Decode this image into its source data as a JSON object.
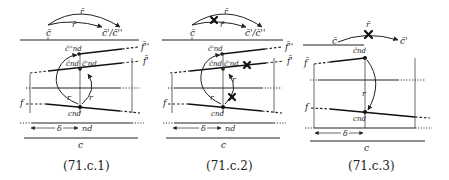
{
  "panels": [
    {
      "id": "71.c.1",
      "caption": "(71.c.1)",
      "labels": {
        "c_bar": "c̄",
        "target": "c̄'/c̄''",
        "r_bar_top": "r̄",
        "r_bar_mid": "r̄",
        "c_nd_pp": "c̄''nd",
        "c_nd_bar": "c̄nd",
        "c_nd_p": "c̄'nd",
        "f_pp": "f̄''",
        "f_p": "f̄'",
        "f": "f",
        "r_left": "r",
        "r_right": "r",
        "c_nd": "cnd",
        "delta": "δ",
        "nd": "nd",
        "c": "c"
      },
      "blocked": []
    },
    {
      "id": "71.c.2",
      "caption": "(71.c.2)",
      "labels": {
        "c_bar": "c̄",
        "target": "c̄'/c̄''",
        "r_bar_top": "r̄",
        "r_bar_mid": "r̄",
        "c_nd_pp": "c̄'nd",
        "c_nd_bar": "c̄nd",
        "c_nd_p": "c̄'nd",
        "f_pp": "f̄''",
        "f_p": "f̄'",
        "f": "f",
        "r_left": "r",
        "r_right": "r",
        "c_nd": "cnd",
        "delta": "δ",
        "nd": "nd",
        "c": "c"
      },
      "blocked": [
        "outer-arc-r-bar",
        "f-prime-line",
        "r-right-arrow"
      ]
    },
    {
      "id": "71.c.3",
      "caption": "(71.c.3)",
      "labels": {
        "c_bar": "c̄",
        "target": "c̄'",
        "r_bar_top": "r̄",
        "c_nd_bar": "c̄nd",
        "f_bar": "f̄",
        "f": "f",
        "r": "r",
        "c_nd": "cnd",
        "delta": "δ",
        "c": "c"
      },
      "blocked": [
        "r-bar-arrow"
      ]
    }
  ]
}
